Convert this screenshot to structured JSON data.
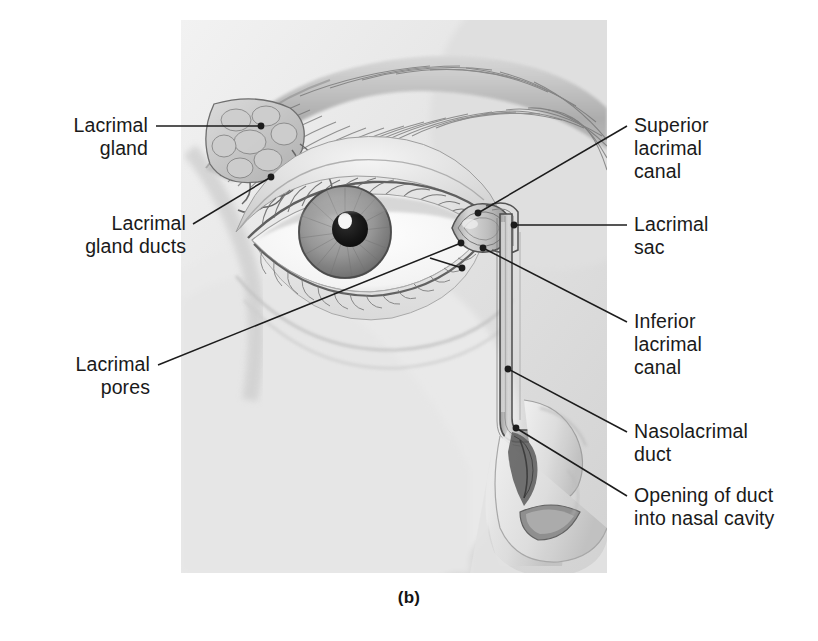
{
  "figure": {
    "caption": "(b)",
    "panel": {
      "x": 181,
      "y": 20,
      "width": 426,
      "height": 553
    }
  },
  "colors": {
    "ink": "#1a1a1a",
    "leader": "#1c1c1c",
    "skin_light": "#eeeeee",
    "skin_mid": "#dcdcdc",
    "skin_shadow": "#bdbdbd",
    "brow_dark": "#7a7a7a",
    "iris_mid": "#8f8f8f",
    "iris_dark": "#5e5e5e",
    "pupil": "#111111",
    "highlight": "#ffffff",
    "duct_fill": "#cfcfcf",
    "duct_edge": "#555555",
    "background": "#ffffff"
  },
  "labels_left": [
    {
      "id": "lacrimal-gland",
      "lines": [
        "Lacrimal",
        "gland"
      ],
      "text_right": 148,
      "text_top": 114,
      "leader": {
        "from_x": 156,
        "from_y": 126,
        "to_x": 261,
        "to_y": 126,
        "dot": true
      }
    },
    {
      "id": "lacrimal-gland-ducts",
      "lines": [
        "Lacrimal",
        "gland ducts"
      ],
      "text_right": 186,
      "text_top": 212,
      "leader": {
        "from_x": 193,
        "from_y": 224,
        "to_x": 271,
        "to_y": 177,
        "dot": true
      }
    },
    {
      "id": "lacrimal-pores",
      "lines": [
        "Lacrimal",
        "pores"
      ],
      "text_right": 150,
      "text_top": 353,
      "leader": {
        "from_x": 158,
        "from_y": 365,
        "to_x": 461,
        "to_y": 243,
        "dot": true
      }
    }
  ],
  "labels_right": [
    {
      "id": "superior-lacrimal-canal",
      "lines": [
        "Superior",
        "lacrimal",
        "canal"
      ],
      "text_left": 634,
      "text_top": 114,
      "leader": {
        "from_x": 627,
        "from_y": 126,
        "to_x": 478,
        "to_y": 213,
        "dot": true
      }
    },
    {
      "id": "lacrimal-sac",
      "lines": [
        "Lacrimal",
        "sac"
      ],
      "text_left": 634,
      "text_top": 213,
      "leader": {
        "from_x": 627,
        "from_y": 225,
        "to_x": 514,
        "to_y": 225,
        "dot": true
      }
    },
    {
      "id": "inferior-lacrimal-canal",
      "lines": [
        "Inferior",
        "lacrimal",
        "canal"
      ],
      "text_left": 634,
      "text_top": 310,
      "leader": {
        "from_x": 627,
        "from_y": 322,
        "to_x": 483,
        "to_y": 248,
        "dot": true
      }
    },
    {
      "id": "nasolacrimal-duct",
      "lines": [
        "Nasolacrimal",
        "duct"
      ],
      "text_left": 634,
      "text_top": 420,
      "leader": {
        "from_x": 627,
        "from_y": 432,
        "to_x": 508,
        "to_y": 369,
        "dot": true
      }
    },
    {
      "id": "opening-of-duct",
      "lines": [
        "Opening of duct",
        "into nasal cavity"
      ],
      "text_left": 634,
      "text_top": 484,
      "leader": {
        "from_x": 627,
        "from_y": 496,
        "to_x": 516,
        "to_y": 428,
        "dot": true
      }
    }
  ],
  "anatomy": {
    "eyebrow": "arched hair mass across upper panel",
    "lacrimal_gland": "lobulated almond mass, superolateral orbit",
    "gland_ducts": "short tubules descending to conjunctival fornix",
    "eyeball": {
      "iris_center_x": 345,
      "iris_center_y": 232,
      "iris_radius": 46,
      "pupil_radius": 18
    },
    "eyelashes": "upper and lower lash rows",
    "lacrimal_sac": "teardrop sac at medial canthus",
    "nasolacrimal_duct": "vertical tube descending to nose",
    "nose": "profile with ala and nostril",
    "duct_opening": "inferior meatus, dark shaded opening"
  }
}
